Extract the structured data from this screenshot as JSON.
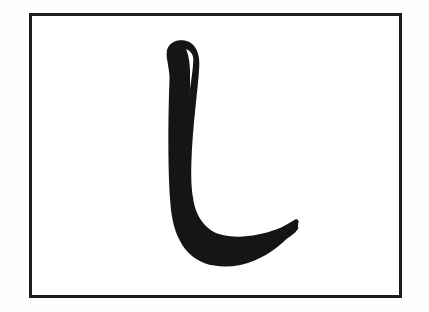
{
  "page": {
    "background_color": "#fefefe",
    "width": 429,
    "height": 312
  },
  "frame": {
    "name": "specimen-border",
    "border_color": "#1c1c1c",
    "border_width_px": 3,
    "fill_color": "#ffffff",
    "x": 29,
    "y": 13,
    "width": 373,
    "height": 285
  },
  "glyph": {
    "label": "hooked vertical stroke",
    "description": "Calligraphic black stroke: a tall vertical shaft descending from the upper area, curving left-to-right at the base into a long sweeping hook that tapers to a fine point at the upper right of the hook.",
    "reading": "ل",
    "ink_color": "#151515",
    "stroke_top_y": 48,
    "stroke_bottom_y": 255,
    "shaft_left_x": 167,
    "shaft_right_x": 193,
    "hook_tip_x": 296,
    "hook_tip_y": 214,
    "strokes": 1
  }
}
